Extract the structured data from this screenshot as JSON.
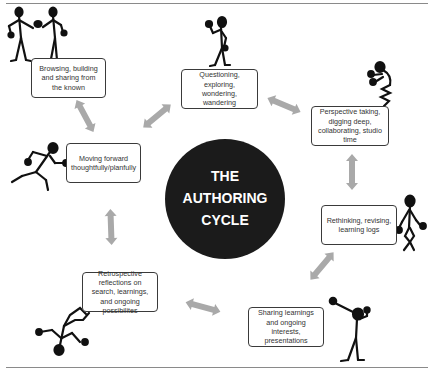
{
  "diagram": {
    "title_lines": [
      "THE",
      "AUTHORING",
      "CYCLE"
    ],
    "center_color": "#1b1b1b",
    "arrow_color": "#a9a9a9",
    "stages": [
      {
        "id": "browsing",
        "label": "Browsing, building and sharing from the known",
        "figure": "two-figures-holding-hands"
      },
      {
        "id": "questioning",
        "label": "Questioning, exploring, wondering, wandering",
        "figure": "figure-walking"
      },
      {
        "id": "perspective",
        "label": "Perspective taking, digging deep, collaborating, studio time",
        "figure": "figure-crouching"
      },
      {
        "id": "rethinking",
        "label": "Rethinking, revising, learning logs",
        "figure": "figure-standing-bent-knees"
      },
      {
        "id": "sharing",
        "label": "Sharing learnings and ongoing interests, presentations",
        "figure": "figure-arm-raised"
      },
      {
        "id": "retrospective",
        "label": "Retrospective reflections on search, learnings, and ongoing possibilites",
        "figure": "figure-upside-down"
      },
      {
        "id": "moving",
        "label": "Moving forward thoughtfully/planfully",
        "figure": "figure-running"
      }
    ],
    "connections": [
      [
        "browsing",
        "moving"
      ],
      [
        "moving",
        "questioning"
      ],
      [
        "questioning",
        "perspective"
      ],
      [
        "perspective",
        "rethinking"
      ],
      [
        "rethinking",
        "sharing"
      ],
      [
        "sharing",
        "retrospective"
      ],
      [
        "retrospective",
        "moving"
      ]
    ]
  }
}
